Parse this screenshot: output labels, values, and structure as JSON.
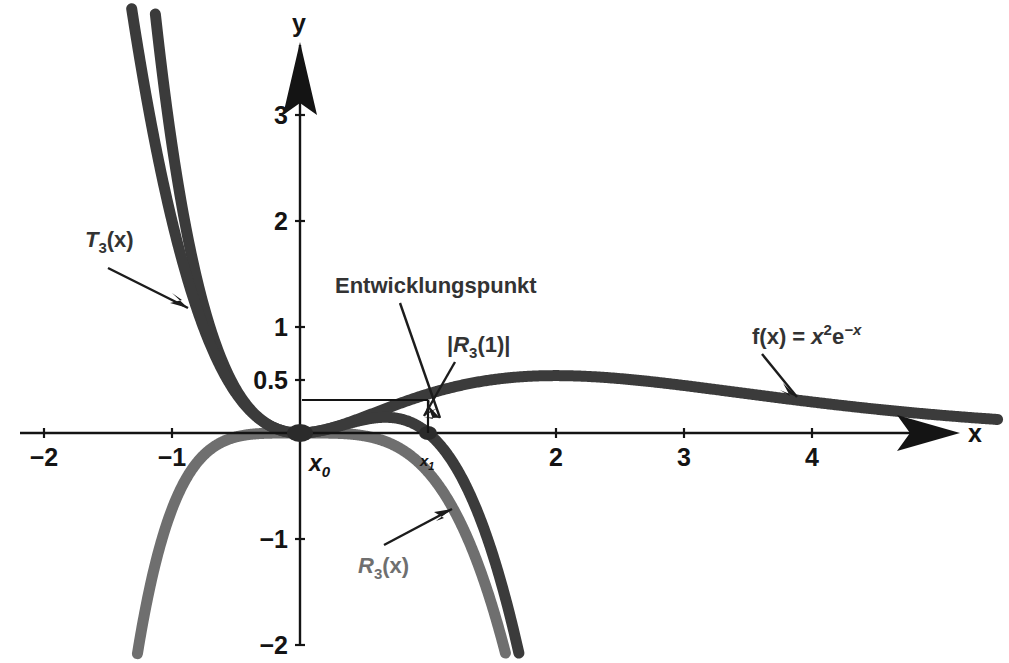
{
  "figure": {
    "background_color": "#ffffff",
    "axis_color": "#141414",
    "curve_colors": {
      "f": "#3b3b3b",
      "T3": "#3b3b3b",
      "R3": "#6f6f6f"
    }
  },
  "axes": {
    "x_axis_label": "x",
    "y_axis_label": "y",
    "x_ticks": [
      {
        "value": -2,
        "label": "−2"
      },
      {
        "value": -1,
        "label": "−1"
      },
      {
        "value": 2,
        "label": "2"
      },
      {
        "value": 3,
        "label": "3"
      },
      {
        "value": 4,
        "label": "4"
      }
    ],
    "y_ticks": [
      {
        "value": 3,
        "label": "3"
      },
      {
        "value": 2,
        "label": "2"
      },
      {
        "value": 1,
        "label": "1"
      },
      {
        "value": 0.5,
        "label": "0.5"
      },
      {
        "value": -1,
        "label": "−1"
      },
      {
        "value": -2,
        "label": "−2"
      }
    ],
    "xlim": [
      -2.35,
      5.4
    ],
    "ylim": [
      -2.1,
      3.75
    ]
  },
  "points": {
    "x0": {
      "base": "x",
      "sub": "0",
      "value": 0
    },
    "x1": {
      "base": "x",
      "sub": "1",
      "value": 1
    }
  },
  "annotations": {
    "expansion_point": {
      "text": "Entwicklungspunkt",
      "target_x": 0,
      "target_y": 0
    },
    "remainder_at_one": {
      "base": "|",
      "italic": "R",
      "sub": "3",
      "tail": "(1)|",
      "full_text": "|R₃(1)|",
      "target_x": 1,
      "target_y": 0.18
    },
    "taylor_label": {
      "italic": "T",
      "sub": "3",
      "tail": "(x)",
      "full_text": "T₃(x)"
    },
    "remainder_label": {
      "italic": "R",
      "sub": "3",
      "tail": "(x)",
      "full_text": "R₃(x)"
    },
    "function_label": {
      "lead": "f(x) = ",
      "italic": "x",
      "sup": "2",
      "mid": "e",
      "sup2": "−x",
      "full_text": "f(x) = x²e⁻ˣ"
    }
  },
  "chart_data": {
    "type": "line",
    "title": "",
    "xlabel": "x",
    "ylabel": "y",
    "xlim": [
      -2.35,
      5.4
    ],
    "ylim": [
      -2.1,
      3.75
    ],
    "grid": false,
    "legend": "annotated labels on curves",
    "series": [
      {
        "name": "f(x) = x²e⁻ˣ",
        "formula": "x^2 * exp(-x)",
        "color": "#3b3b3b",
        "x": [
          -2.0,
          -1.75,
          -1.5,
          -1.25,
          -1.0,
          -0.75,
          -0.5,
          -0.25,
          0.0,
          0.25,
          0.5,
          0.75,
          1.0,
          1.5,
          2.0,
          2.5,
          3.0,
          3.5,
          4.0,
          4.5,
          5.0
        ],
        "y": [
          29.56,
          17.6,
          10.08,
          5.46,
          2.72,
          1.19,
          0.41,
          0.08,
          0.0,
          0.049,
          0.152,
          0.266,
          0.368,
          0.502,
          0.541,
          0.513,
          0.448,
          0.37,
          0.293,
          0.225,
          0.168
        ]
      },
      {
        "name": "T₃(x) = x² − x³",
        "formula": "x^2 - x^3",
        "color": "#3b3b3b",
        "x": [
          -2.0,
          -1.75,
          -1.5,
          -1.25,
          -1.0,
          -0.75,
          -0.5,
          -0.25,
          0.0,
          0.25,
          0.5,
          0.75,
          1.0,
          1.25,
          1.5,
          1.75,
          2.0
        ],
        "y": [
          12.0,
          8.42,
          5.63,
          3.52,
          2.0,
          0.98,
          0.375,
          0.078,
          0.0,
          0.047,
          0.125,
          0.141,
          0.0,
          -0.39,
          -1.125,
          -2.3,
          -4.0
        ]
      },
      {
        "name": "R₃(x) = f(x) − T₃(x)",
        "formula": "x^2*exp(-x) - (x^2 - x^3)",
        "color": "#6f6f6f",
        "x": [
          -2.0,
          -1.75,
          -1.5,
          -1.25,
          -1.0,
          -0.75,
          -0.5,
          -0.25,
          0.0,
          0.25,
          0.5,
          0.75,
          1.0,
          1.25,
          1.5,
          1.75,
          2.0
        ],
        "y": [
          17.56,
          9.18,
          4.45,
          1.94,
          0.72,
          0.21,
          0.037,
          0.003,
          0.0,
          0.002,
          0.027,
          0.125,
          0.368,
          0.787,
          1.627,
          2.8,
          4.54
        ]
      }
    ],
    "markers": [
      {
        "name": "x0",
        "x": 0,
        "y": 0,
        "label": "x₀"
      },
      {
        "name": "x1",
        "x": 1,
        "y": 0,
        "label": "x₁"
      }
    ],
    "annotations": [
      {
        "text": "Entwicklungspunkt",
        "x": 0,
        "y": 0
      },
      {
        "text": "|R₃(1)|",
        "x": 1,
        "y": 0.18
      },
      {
        "text": "T₃(x)",
        "x": -1.35,
        "y": 1.55
      },
      {
        "text": "R₃(x)",
        "x": -0.2,
        "y": -1.25
      },
      {
        "text": "f(x) = x²e⁻ˣ",
        "x": 4.2,
        "y": 0.86
      }
    ]
  }
}
